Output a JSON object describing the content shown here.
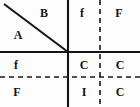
{
  "figure": {
    "width": 140,
    "height": 107,
    "background_color": "#fdfdfd",
    "ink_color": "#141414"
  },
  "lines": {
    "vertical_solid": {
      "name": "vertical-axis",
      "x": 68,
      "y1": 0,
      "y2": 107,
      "style": "solid",
      "width": 2.1,
      "color": "#141414"
    },
    "horizontal_solid": {
      "name": "horizontal-axis",
      "y": 52,
      "x1": 0,
      "x2": 140,
      "style": "solid",
      "width": 2.1,
      "color": "#141414"
    },
    "vertical_dashed": {
      "name": "vertical-dashed-divider",
      "x": 100,
      "y1": 0,
      "y2": 107,
      "style": "dashed",
      "width": 1.6,
      "color": "#1a1a1a",
      "dash": "5,4"
    },
    "horizontal_dashed": {
      "name": "horizontal-dashed-divider",
      "y": 77,
      "x1": 0,
      "x2": 140,
      "style": "dashed",
      "width": 1.6,
      "color": "#1a1a1a",
      "dash": "5,4"
    },
    "diagonal": {
      "name": "diagonal-line",
      "x1": 4,
      "y1": 4,
      "x2": 68,
      "y2": 52,
      "style": "solid",
      "width": 2.1,
      "color": "#141414"
    }
  },
  "labels": [
    {
      "id": "label-a",
      "text": "A",
      "x": 18,
      "y": 35,
      "case": "cap"
    },
    {
      "id": "label-b",
      "text": "B",
      "x": 44,
      "y": 13,
      "case": "cap"
    },
    {
      "id": "label-f-top",
      "text": "f",
      "x": 82,
      "y": 13,
      "case": "low"
    },
    {
      "id": "label-f-top-right",
      "text": "F",
      "x": 119,
      "y": 13,
      "case": "cap"
    },
    {
      "id": "label-f-mid-left",
      "text": "f",
      "x": 16,
      "y": 65,
      "case": "low"
    },
    {
      "id": "label-c-mid",
      "text": "C",
      "x": 84,
      "y": 65,
      "case": "cap"
    },
    {
      "id": "label-c-mid-right",
      "text": "C",
      "x": 120,
      "y": 65,
      "case": "cap"
    },
    {
      "id": "label-f-bottom",
      "text": "F",
      "x": 17,
      "y": 92,
      "case": "cap"
    },
    {
      "id": "label-i-bottom",
      "text": "I",
      "x": 84,
      "y": 92,
      "case": "cap"
    },
    {
      "id": "label-c-bottom",
      "text": "C",
      "x": 120,
      "y": 92,
      "case": "cap"
    }
  ]
}
